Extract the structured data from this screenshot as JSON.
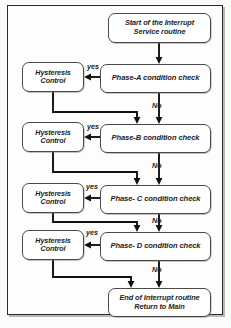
{
  "diagram": {
    "type": "flowchart",
    "nodes": {
      "start": {
        "line1": "Start of the Interrupt",
        "line2": "Service routine"
      },
      "end": {
        "line1": "End of Interrupt routine",
        "line2": "Return to Main"
      },
      "phase_a": {
        "label": "Phase-A condition check"
      },
      "phase_b": {
        "label": "Phase-B condition check"
      },
      "phase_c": {
        "label": "Phase- C condition check"
      },
      "phase_d": {
        "label": "Phase- D condition check"
      },
      "hyst_a": {
        "line1": "Hysteresis",
        "line2": "Control"
      },
      "hyst_b": {
        "line1": "Hysteresis",
        "line2": "Control"
      },
      "hyst_c": {
        "line1": "Hysteresis",
        "line2": "Control"
      },
      "hyst_d": {
        "line1": "Hysteresis",
        "line2": "Control"
      }
    },
    "edge_labels": {
      "yes_a": "yes",
      "yes_b": "yes",
      "yes_c": "yes",
      "yes_d": "yes",
      "no_a": "No",
      "no_b": "No",
      "no_c": "No",
      "no_d": "No"
    },
    "colors": {
      "stroke": "#111111",
      "node_border": "#4a4a4a",
      "node_fill": "#ffffff",
      "frame": "#2a2a2a",
      "background": "#fbfbfa"
    }
  }
}
